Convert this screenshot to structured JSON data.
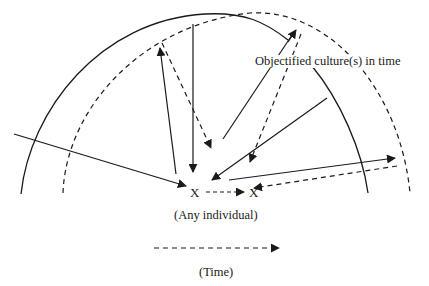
{
  "diagram": {
    "title_label": "Objectified culture(s) in time",
    "individual_marker_left": "X",
    "individual_marker_right": "X",
    "individual_label": "(Any individual)",
    "time_label": "(Time)",
    "colors": {
      "line": "#1a1a1a",
      "background": "#ffffff"
    },
    "elements": {
      "solid_arc": "Objectified culture at earlier time (solid boundary)",
      "dashed_arc": "Objectified culture at later time (dashed boundary)",
      "solid_arrows": "Influences between culture and individual (earlier)",
      "dashed_arrows": "Influences between culture and individual (later)",
      "time_arrow": "Dashed arrow indicating direction of time"
    }
  }
}
